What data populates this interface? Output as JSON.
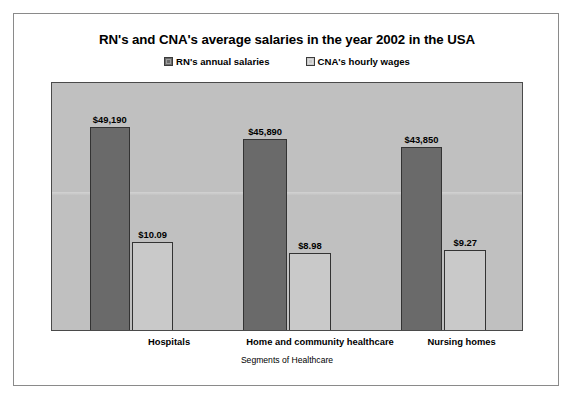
{
  "chart_data": {
    "type": "bar",
    "title": "RN's and CNA's average salaries in the year 2002 in the USA",
    "xlabel": "Segments of Healthcare",
    "ylabel": "",
    "grid": false,
    "legend_position": "top",
    "categories": [
      "Hospitals",
      "Home and community healthcare",
      "Nursing homes"
    ],
    "series": [
      {
        "name": "RN's annual salaries",
        "color": "#6a6a6a",
        "values": [
          49190,
          45890,
          43850
        ],
        "labels": [
          "$49,190",
          "$45,890",
          "$43,850"
        ]
      },
      {
        "name": "CNA's hourly wages",
        "color": "#c9c9c9",
        "values": [
          10.09,
          8.98,
          9.27
        ],
        "labels": [
          "$10.09",
          "$8.98",
          "$9.27"
        ]
      }
    ],
    "ylim": [
      0,
      60000
    ],
    "bars": [
      {
        "series": 0,
        "category": 0,
        "label": "$49,190",
        "left_pct": 8.05,
        "width_pct": 8.47,
        "height_pct": 82.3
      },
      {
        "series": 1,
        "category": 0,
        "label": "$10.09",
        "left_pct": 16.95,
        "width_pct": 8.9,
        "height_pct": 35.7
      },
      {
        "series": 0,
        "category": 1,
        "label": "$45,890",
        "left_pct": 40.68,
        "width_pct": 9.32,
        "height_pct": 77.5
      },
      {
        "series": 1,
        "category": 1,
        "label": "$8.98",
        "left_pct": 50.42,
        "width_pct": 8.9,
        "height_pct": 31.3
      },
      {
        "series": 0,
        "category": 2,
        "label": "$43,850",
        "left_pct": 74.15,
        "width_pct": 8.9,
        "height_pct": 73.9
      },
      {
        "series": 1,
        "category": 2,
        "label": "$9.27",
        "left_pct": 83.47,
        "width_pct": 8.9,
        "height_pct": 32.5
      }
    ],
    "category_positions_pct": [
      25.0,
      57.0,
      87.0
    ]
  },
  "colors": {
    "plot_background": "#c0c0c0",
    "frame_border": "#8a8a8a",
    "bar_outline": "#333333",
    "series_rn": "#6a6a6a",
    "series_cna": "#c9c9c9",
    "text": "#000000"
  }
}
